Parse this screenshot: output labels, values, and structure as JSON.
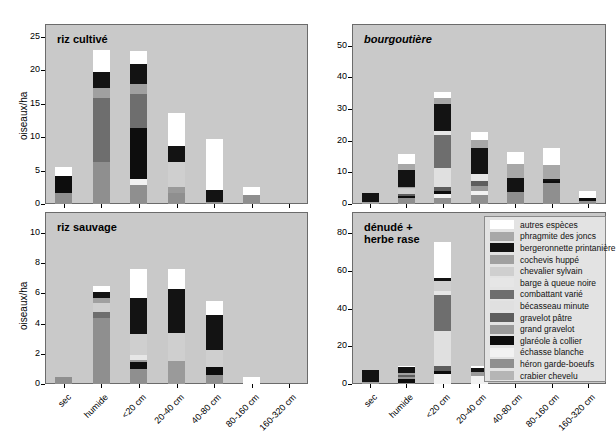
{
  "figure": {
    "ylabel": "oiseaux/ha",
    "categories": [
      "sec",
      "humide",
      "<20 cm",
      "20-40 cm",
      "40-80 cm",
      "80-160 cm",
      "160-320 cm"
    ]
  },
  "legend": {
    "title": "",
    "items": [
      {
        "label": "autres espèces",
        "color": "#ffffff"
      },
      {
        "label": "phragmite des joncs",
        "color": "#a8a8a8"
      },
      {
        "label": "bergeronnette printanière",
        "color": "#131313"
      },
      {
        "label": "cochevis huppé",
        "color": "#a0a0a0"
      },
      {
        "label": "chevalier sylvain",
        "color": "#cfcfcf"
      },
      {
        "label": "barge à queue noire",
        "color": "#e6e6e6"
      },
      {
        "label": "combattant varié",
        "color": "#6e6e6e"
      },
      {
        "label": "bécasseau minute",
        "color": "#e0e0e0"
      },
      {
        "label": "gravelot pâtre",
        "color": "#5e5e5e"
      },
      {
        "label": "grand gravelot",
        "color": "#9a9a9a"
      },
      {
        "label": "glaréole à collier",
        "color": "#0d0d0d"
      },
      {
        "label": "échasse blanche",
        "color": "#f2f2f2"
      },
      {
        "label": "héron garde-boeufs",
        "color": "#8f8f8f"
      },
      {
        "label": "crabier chevelu",
        "color": "#b5b5b5"
      }
    ]
  },
  "chart_data": [
    {
      "type": "bar",
      "stacked": true,
      "panel_id": "riz-cultive",
      "title": "riz cultivé",
      "title_italic": false,
      "ylabel": "oiseaux/ha",
      "xlabel": "",
      "ylim": [
        0,
        26
      ],
      "yticks": [
        0,
        5,
        10,
        15,
        20,
        25
      ],
      "grid": false,
      "categories": [
        "sec",
        "humide",
        "<20 cm",
        "20-40 cm",
        "40-80 cm",
        "80-160 cm",
        "160-320 cm"
      ],
      "series": [
        {
          "name": "crabier chevelu",
          "values": [
            0.0,
            0.0,
            0.0,
            0.0,
            0.0,
            0.0,
            0.0
          ]
        },
        {
          "name": "héron garde-boeufs",
          "values": [
            1.7,
            6.3,
            2.9,
            1.7,
            0.3,
            1.4,
            0.0
          ]
        },
        {
          "name": "échasse blanche",
          "values": [
            0.0,
            0.0,
            0.9,
            0.0,
            0.0,
            0.0,
            0.0
          ]
        },
        {
          "name": "glaréole à collier",
          "values": [
            2.5,
            0.0,
            7.6,
            0.0,
            0.0,
            0.0,
            0.0
          ]
        },
        {
          "name": "grand gravelot",
          "values": [
            0.0,
            0.0,
            0.0,
            0.8,
            0.0,
            0.0,
            0.0
          ]
        },
        {
          "name": "gravelot pâtre",
          "values": [
            0.0,
            0.0,
            0.0,
            0.0,
            0.0,
            0.0,
            0.0
          ]
        },
        {
          "name": "bécasseau minute",
          "values": [
            0.0,
            0.0,
            0.0,
            0.0,
            0.0,
            0.0,
            0.0
          ]
        },
        {
          "name": "combattant varié",
          "values": [
            0.0,
            9.5,
            5.1,
            0.0,
            0.0,
            0.0,
            0.0
          ]
        },
        {
          "name": "barge à queue noire",
          "values": [
            0.0,
            0.0,
            0.0,
            0.0,
            0.0,
            0.0,
            0.0
          ]
        },
        {
          "name": "chevalier sylvain",
          "values": [
            0.0,
            0.0,
            0.0,
            3.8,
            0.0,
            0.0,
            0.0
          ]
        },
        {
          "name": "cochevis huppé",
          "values": [
            0.0,
            1.5,
            1.5,
            0.0,
            0.0,
            0.0,
            0.0
          ]
        },
        {
          "name": "bergeronnette printanière",
          "values": [
            0.0,
            2.4,
            2.9,
            2.3,
            1.8,
            0.0,
            0.0
          ]
        },
        {
          "name": "phragmite des joncs",
          "values": [
            0.0,
            0.0,
            0.0,
            0.0,
            0.0,
            0.0,
            0.0
          ]
        },
        {
          "name": "autres espèces",
          "values": [
            1.4,
            3.3,
            2.0,
            5.0,
            7.6,
            1.1,
            0.0
          ]
        }
      ],
      "totals": [
        5.6,
        23.0,
        22.9,
        13.6,
        9.7,
        2.5,
        0.0
      ]
    },
    {
      "type": "bar",
      "stacked": true,
      "panel_id": "bourgoutiere",
      "title": "bourgoutière",
      "title_italic": true,
      "ylabel": "",
      "xlabel": "",
      "ylim": [
        0,
        55
      ],
      "yticks": [
        0,
        10,
        20,
        30,
        40,
        50
      ],
      "grid": false,
      "categories": [
        "sec",
        "humide",
        "<20 cm",
        "20-40 cm",
        "40-80 cm",
        "80-160 cm",
        "160-320 cm"
      ],
      "series": [
        {
          "name": "crabier chevelu",
          "values": [
            0.0,
            0.0,
            0.0,
            0.0,
            0.0,
            0.0,
            0.0
          ]
        },
        {
          "name": "héron garde-boeufs",
          "values": [
            0.0,
            1.8,
            1.9,
            2.8,
            3.9,
            6.6,
            1.1
          ]
        },
        {
          "name": "échasse blanche",
          "values": [
            0.0,
            0.0,
            1.4,
            1.2,
            0.0,
            0.0,
            0.0
          ]
        },
        {
          "name": "glaréole à collier",
          "values": [
            0.0,
            0.6,
            0.8,
            0.0,
            0.0,
            0.6,
            0.8
          ]
        },
        {
          "name": "grand gravelot",
          "values": [
            0.0,
            0.0,
            0.0,
            1.6,
            0.0,
            0.0,
            0.0
          ]
        },
        {
          "name": "gravelot pâtre",
          "values": [
            0.0,
            0.9,
            1.2,
            1.7,
            0.0,
            0.0,
            0.0
          ]
        },
        {
          "name": "bécasseau minute",
          "values": [
            0.0,
            0.0,
            6.0,
            0.0,
            0.0,
            0.0,
            0.0
          ]
        },
        {
          "name": "combattant varié",
          "values": [
            0.0,
            0.0,
            10.5,
            0.0,
            0.0,
            0.0,
            0.0
          ]
        },
        {
          "name": "barge à queue noire",
          "values": [
            0.0,
            0.0,
            1.2,
            2.3,
            0.0,
            0.0,
            0.0
          ]
        },
        {
          "name": "chevalier sylvain",
          "values": [
            0.0,
            1.6,
            0.0,
            0.0,
            0.0,
            0.0,
            0.0
          ]
        },
        {
          "name": "cochevis huppé",
          "values": [
            0.6,
            0.6,
            0.0,
            0.0,
            0.0,
            0.0,
            0.0
          ]
        },
        {
          "name": "bergeronnette printanière",
          "values": [
            3.0,
            5.4,
            8.7,
            8.0,
            4.2,
            0.7,
            0.0
          ]
        },
        {
          "name": "phragmite des joncs",
          "values": [
            0.0,
            1.8,
            1.9,
            2.5,
            4.4,
            4.4,
            0.0
          ]
        },
        {
          "name": "autres espèces",
          "values": [
            0.0,
            3.0,
            1.8,
            2.7,
            3.8,
            5.4,
            2.1
          ]
        }
      ],
      "totals": [
        4.3,
        16.1,
        44.5,
        26.7,
        21.4,
        17.5,
        4.1
      ]
    },
    {
      "type": "bar",
      "stacked": true,
      "panel_id": "riz-sauvage",
      "title": "riz sauvage",
      "title_italic": false,
      "ylabel": "oiseaux/ha",
      "xlabel": "",
      "ylim": [
        0,
        11
      ],
      "yticks": [
        0,
        2,
        4,
        6,
        8,
        10
      ],
      "grid": false,
      "categories": [
        "sec",
        "humide",
        "<20 cm",
        "20-40 cm",
        "40-80 cm",
        "80-160 cm",
        "160-320 cm"
      ],
      "series": [
        {
          "name": "crabier chevelu",
          "values": [
            0.0,
            0.0,
            0.0,
            0.0,
            0.0,
            0.0,
            0.0
          ]
        },
        {
          "name": "héron garde-boeufs",
          "values": [
            0.45,
            4.4,
            1.0,
            0.0,
            0.6,
            0.0,
            0.0
          ]
        },
        {
          "name": "échasse blanche",
          "values": [
            0.0,
            0.0,
            0.0,
            0.0,
            0.0,
            0.0,
            0.0
          ]
        },
        {
          "name": "glaréole à collier",
          "values": [
            0.0,
            0.0,
            0.45,
            0.0,
            0.55,
            0.0,
            0.0
          ]
        },
        {
          "name": "grand gravelot",
          "values": [
            0.0,
            0.0,
            0.15,
            1.5,
            0.0,
            0.0,
            0.0
          ]
        },
        {
          "name": "gravelot pâtre",
          "values": [
            0.0,
            0.0,
            0.0,
            0.0,
            0.0,
            0.0,
            0.0
          ]
        },
        {
          "name": "bécasseau minute",
          "values": [
            0.0,
            0.0,
            0.0,
            0.0,
            0.0,
            0.0,
            0.0
          ]
        },
        {
          "name": "combattant varié",
          "values": [
            0.0,
            0.4,
            0.0,
            0.0,
            0.0,
            0.0,
            0.0
          ]
        },
        {
          "name": "barge à queue noire",
          "values": [
            0.0,
            0.0,
            0.3,
            0.0,
            0.0,
            0.0,
            0.0
          ]
        },
        {
          "name": "chevalier sylvain",
          "values": [
            0.0,
            0.55,
            1.4,
            1.9,
            1.1,
            0.0,
            0.0
          ]
        },
        {
          "name": "cochevis huppé",
          "values": [
            0.0,
            0.35,
            0.0,
            0.0,
            0.0,
            0.0,
            0.0
          ]
        },
        {
          "name": "bergeronnette printanière",
          "values": [
            0.0,
            0.4,
            2.4,
            2.9,
            2.35,
            0.0,
            0.0
          ]
        },
        {
          "name": "phragmite des joncs",
          "values": [
            0.0,
            0.0,
            0.0,
            0.0,
            0.0,
            0.0,
            0.0
          ]
        },
        {
          "name": "autres espèces",
          "values": [
            0.0,
            0.4,
            1.9,
            1.3,
            0.9,
            0.45,
            0.0
          ]
        }
      ],
      "totals": [
        0.45,
        6.5,
        7.9,
        7.7,
        5.5,
        0.45,
        0.0
      ]
    },
    {
      "type": "bar",
      "stacked": true,
      "panel_id": "denude-herbe-rase",
      "title": "dénudé +\nherbe rase",
      "title_italic": false,
      "ylabel": "",
      "xlabel": "",
      "ylim": [
        0,
        88
      ],
      "yticks": [
        0,
        20,
        40,
        60,
        80
      ],
      "grid": false,
      "categories": [
        "sec",
        "humide",
        "<20 cm",
        "20-40 cm",
        "40-80 cm",
        "80-160 cm",
        "160-320 cm"
      ],
      "series": [
        {
          "name": "crabier chevelu",
          "values": [
            0.0,
            0.0,
            0.0,
            0.0,
            0.0,
            0.0,
            0.0
          ]
        },
        {
          "name": "héron garde-boeufs",
          "values": [
            0.0,
            0.6,
            0.0,
            0.0,
            0.0,
            0.0,
            0.0
          ]
        },
        {
          "name": "échasse blanche",
          "values": [
            0.0,
            0.0,
            5.5,
            4.5,
            0.0,
            0.0,
            0.0
          ]
        },
        {
          "name": "glaréole à collier",
          "values": [
            0.0,
            1.8,
            1.3,
            0.0,
            0.0,
            0.0,
            0.0
          ]
        },
        {
          "name": "grand gravelot",
          "values": [
            0.0,
            1.4,
            0.0,
            2.0,
            0.0,
            0.0,
            0.0
          ]
        },
        {
          "name": "gravelot pâtre",
          "values": [
            0.0,
            1.1,
            2.6,
            0.0,
            0.0,
            0.0,
            0.0
          ]
        },
        {
          "name": "bécasseau minute",
          "values": [
            0.0,
            0.0,
            18.5,
            0.0,
            0.0,
            0.0,
            0.0
          ]
        },
        {
          "name": "combattant varié",
          "values": [
            0.0,
            0.0,
            19.5,
            0.0,
            0.0,
            0.0,
            0.0
          ]
        },
        {
          "name": "barge à queue noire",
          "values": [
            0.0,
            0.0,
            1.8,
            0.0,
            0.0,
            0.0,
            0.0
          ]
        },
        {
          "name": "chevalier sylvain",
          "values": [
            0.0,
            0.0,
            5.6,
            0.0,
            0.0,
            0.0,
            0.0
          ]
        },
        {
          "name": "cochevis huppé",
          "values": [
            1.3,
            1.0,
            0.0,
            0.0,
            0.0,
            0.0,
            0.0
          ]
        },
        {
          "name": "bergeronnette printanière",
          "values": [
            6.3,
            3.3,
            1.6,
            1.9,
            0.0,
            0.0,
            0.0
          ]
        },
        {
          "name": "phragmite des joncs",
          "values": [
            0.0,
            0.0,
            0.0,
            0.0,
            0.0,
            0.0,
            0.0
          ]
        },
        {
          "name": "autres espèces",
          "values": [
            0.0,
            0.6,
            19.0,
            1.4,
            0.0,
            0.0,
            0.0
          ]
        }
      ],
      "totals": [
        7.6,
        9.8,
        75.4,
        9.8,
        0.0,
        0.0,
        0.0
      ]
    }
  ]
}
